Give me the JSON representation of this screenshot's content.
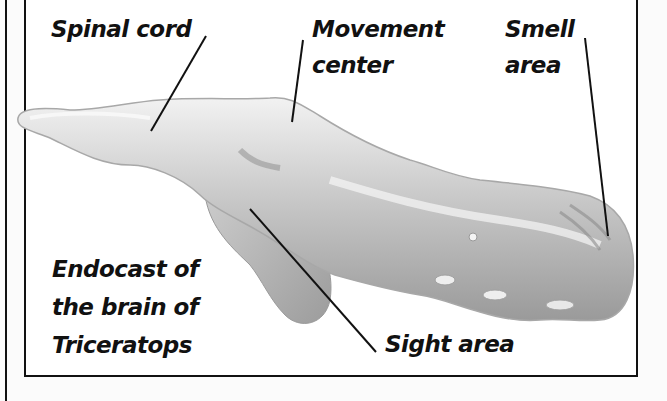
{
  "figure": {
    "title_lines": [
      "Endocast of",
      "the brain of",
      "Triceratops"
    ],
    "labels": {
      "spinal_cord": "Spinal cord",
      "movement_center_line1": "Movement",
      "movement_center_line2": "center",
      "smell_area_line1": "Smell",
      "smell_area_line2": "area",
      "sight_area": "Sight area"
    },
    "colors": {
      "ink": "#111111",
      "background": "#ffffff",
      "endocast_light": "#e6e6e6",
      "endocast_mid": "#b8b8b8",
      "endocast_dark": "#8a8a8a"
    }
  }
}
